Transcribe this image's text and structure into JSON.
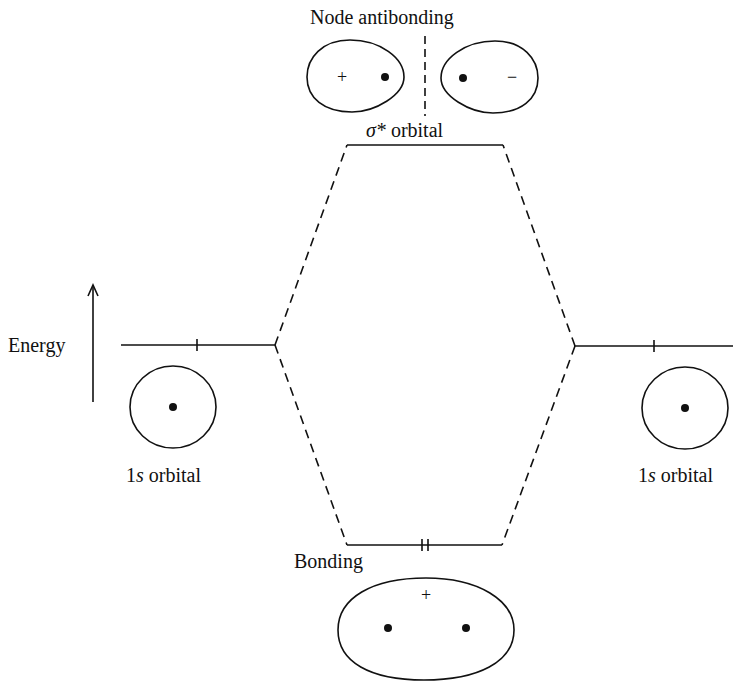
{
  "diagram": {
    "axis": {
      "label": "Energy",
      "direction": "up"
    },
    "levels": {
      "antibonding": {
        "label_prefix": "σ*",
        "label_suffix": " orbital",
        "header": "Node antibonding",
        "electrons": 0,
        "lobe_signs": [
          "+",
          "−"
        ]
      },
      "left_atomic": {
        "label_prefix": "1",
        "label_italic": "s",
        "label_suffix": " orbital",
        "electrons": 1
      },
      "right_atomic": {
        "label_prefix": "1",
        "label_italic": "s",
        "label_suffix": " orbital",
        "electrons": 1
      },
      "bonding": {
        "label": "Bonding",
        "electrons": 2,
        "sign": "+"
      }
    }
  }
}
